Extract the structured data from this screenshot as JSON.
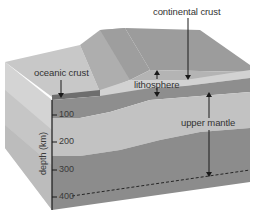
{
  "diagram": {
    "labels": {
      "continental_crust": "continental crust",
      "oceanic_crust": "oceanic crust",
      "lithosphere": "lithosphere",
      "upper_mantle": "upper mantle"
    },
    "axis": {
      "title": "depth (km)",
      "ticks": [
        "100",
        "200",
        "300",
        "400"
      ]
    },
    "colors": {
      "surface_light": "#c4c4c4",
      "surface_mid": "#a8a8a8",
      "surface_dark": "#989898",
      "crust_light": "#d2d2d2",
      "lithosphere_band": "#8e8e8e",
      "mantle_light": "#c0c0c0",
      "mantle_dark": "#8c8c8c",
      "side_face": "#d0d0d0",
      "line": "#1a1a1a"
    }
  }
}
